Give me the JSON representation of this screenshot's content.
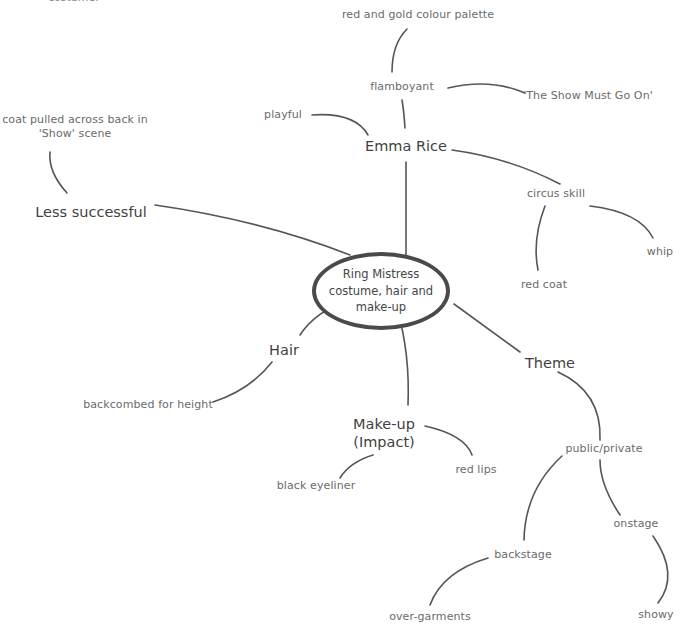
{
  "mindmap": {
    "center": "Ring Mistress costume, hair and make-up",
    "top_fragment": "costume.",
    "branches": [
      {
        "label": "Emma Rice",
        "children": [
          {
            "label": "flamboyant",
            "children": [
              {
                "label": "red and gold colour palette"
              },
              {
                "label": "'The Show Must Go On'"
              }
            ]
          },
          {
            "label": "playful"
          },
          {
            "label": "circus skill",
            "children": [
              {
                "label": "red coat"
              },
              {
                "label": "whip"
              }
            ]
          }
        ]
      },
      {
        "label": "Less successful",
        "children": [
          {
            "label": "coat pulled across back in 'Show' scene"
          }
        ]
      },
      {
        "label": "Hair",
        "children": [
          {
            "label": "backcombed for height"
          }
        ]
      },
      {
        "label": "Make-up (Impact)",
        "children": [
          {
            "label": "black eyeliner"
          },
          {
            "label": "red lips"
          }
        ]
      },
      {
        "label": "Theme",
        "children": [
          {
            "label": "public/private",
            "children": [
              {
                "label": "backstage",
                "children": [
                  {
                    "label": "over-garments"
                  }
                ]
              },
              {
                "label": "onstage",
                "children": [
                  {
                    "label": "showy"
                  }
                ]
              }
            ]
          }
        ]
      }
    ]
  },
  "labels": {
    "center_line1": "Ring Mistress",
    "center_line2": "costume, hair and",
    "center_line3": "make-up",
    "coat_line1": "coat pulled across back in",
    "coat_line2": "'Show' scene",
    "makeup_line1": "Make-up",
    "makeup_line2": "(Impact)"
  },
  "colors": {
    "line": "#555555",
    "text": "#555555",
    "ellipse_border": "#4a4a4a",
    "background": "#ffffff"
  }
}
